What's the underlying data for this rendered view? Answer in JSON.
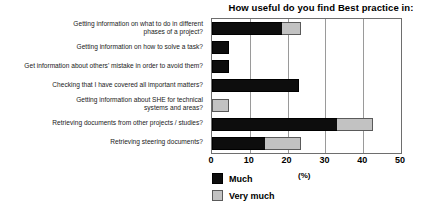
{
  "chart_data": {
    "type": "bar",
    "orientation": "horizontal",
    "stacked": true,
    "title": "How useful do you find Best practice in:",
    "xlabel": "(%)",
    "ylabel": "",
    "xlim": [
      0,
      50
    ],
    "xticks": [
      0,
      10,
      20,
      30,
      40,
      50
    ],
    "xticklabels": [
      "0",
      "10",
      "20",
      "30",
      "40",
      "50"
    ],
    "grid": "vertical",
    "legend_position": "below-left",
    "categories": [
      "Getting information on what to do in different\nphases of a project?",
      "Getting information on how to solve a task?",
      "Get information about others' mistake in order to avoid them?",
      "Checking that I have covered all important matters?",
      "Getting information about SHE for technical\nsystems and areas?",
      "Retrieving documents from other projects / studies?",
      "Retrieving steering documents?"
    ],
    "series": [
      {
        "name": "Much",
        "color": "#0d0d0d",
        "values": [
          18.5,
          4.5,
          4.5,
          23.0,
          0.0,
          33.0,
          14.0
        ]
      },
      {
        "name": "Very much",
        "color": "#c2c2c2",
        "values": [
          5.0,
          0.0,
          0.0,
          0.0,
          4.5,
          9.5,
          9.5
        ]
      }
    ],
    "totals": [
      23.5,
      4.5,
      4.5,
      23.0,
      4.5,
      42.5,
      23.5
    ]
  },
  "legend": {
    "items": [
      {
        "label": "Much",
        "swatch": "black-square-swatch"
      },
      {
        "label": "Very much",
        "swatch": "gray-square-swatch"
      }
    ],
    "unit_label": "(%)"
  },
  "colors": {
    "much": "#0d0d0d",
    "very_much": "#c2c2c2",
    "gridline": "#9a9a9a",
    "frame": "#6e6e6e",
    "background": "#ffffff",
    "text": "#000000"
  }
}
